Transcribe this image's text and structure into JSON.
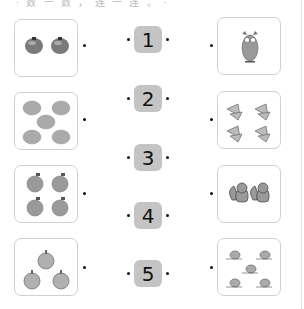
{
  "header": {
    "instruction_text": "· 数 一 数 ， 连 一 连 。 ·"
  },
  "numbers": [
    {
      "label": "1"
    },
    {
      "label": "2"
    },
    {
      "label": "3"
    },
    {
      "label": "4"
    },
    {
      "label": "5"
    }
  ],
  "left_cards": [
    {
      "item": "tomato",
      "count": 2
    },
    {
      "item": "pumpkin",
      "count": 5
    },
    {
      "item": "peach",
      "count": 4
    },
    {
      "item": "onion",
      "count": 3
    }
  ],
  "right_cards": [
    {
      "item": "owl",
      "count": 1
    },
    {
      "item": "butterfly",
      "count": 4
    },
    {
      "item": "squirrel",
      "count": 2
    },
    {
      "item": "snail",
      "count": 5
    }
  ],
  "colors": {
    "number_bg": "#c4c4c4",
    "card_border": "#d0d0d0"
  }
}
